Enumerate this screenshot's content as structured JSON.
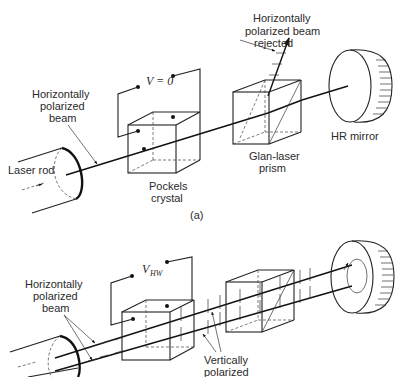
{
  "panel_a": {
    "label": "(a)",
    "voltage_label": "V = 0",
    "labels": {
      "rejected_line1": "Horizontally",
      "rejected_line2": "polarized beam",
      "rejected_line3": "rejected",
      "beam_line1": "Horizontally",
      "beam_line2": "polarized",
      "beam_line3": "beam",
      "laser_rod": "Laser rod",
      "pockels_line1": "Pockels",
      "pockels_line2": "crystal",
      "prism_line1": "Glan-laser",
      "prism_line2": "prism",
      "mirror": "HR mirror"
    }
  },
  "panel_b": {
    "voltage_label_main": "V",
    "voltage_label_sub": "HW",
    "labels": {
      "beam_line1": "Horizontally",
      "beam_line2": "polarized",
      "beam_line3": "beam",
      "vertical_line1": "Vertically",
      "vertical_line2": "polarized"
    }
  },
  "colors": {
    "background": "#ffffff",
    "ink": "#222222"
  }
}
